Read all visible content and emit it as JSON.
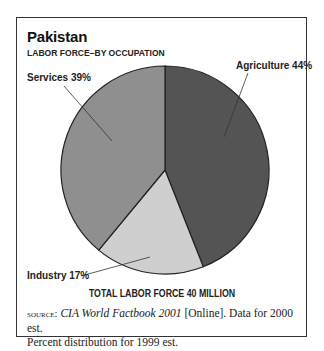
{
  "title": "Pakistan",
  "subtitle": "LABOR FORCE–BY OCCUPATION",
  "total_label": "TOTAL LABOR FORCE 40 MILLION",
  "source": {
    "prefix": "source:",
    "publication": "CIA World Factbook 2001",
    "rest_line1": " [Online]. Data for 2000 est.",
    "line2": "Percent distribution for 1999 est."
  },
  "labels": {
    "agriculture": "Agriculture 44%",
    "services": "Services 39%",
    "industry": "Industry 17%"
  },
  "colors": {
    "agriculture": "#545454",
    "industry": "#cfcfcf",
    "services": "#8f8f8f",
    "outline": "#222222"
  },
  "chart_data": {
    "type": "pie",
    "title": "Pakistan",
    "subtitle": "LABOR FORCE–BY OCCUPATION",
    "categories": [
      "Agriculture",
      "Industry",
      "Services"
    ],
    "values": [
      44,
      17,
      39
    ],
    "unit": "%",
    "annotations": [
      "TOTAL LABOR FORCE 40 MILLION"
    ],
    "legend": "none (direct labels)",
    "start_angle": "12 o'clock, clockwise"
  }
}
